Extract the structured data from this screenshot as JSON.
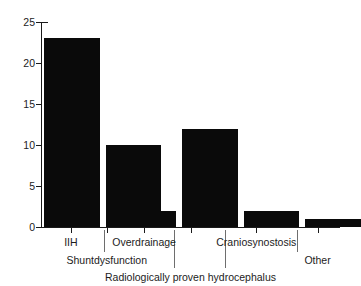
{
  "chart_data": {
    "type": "bar",
    "title": "",
    "subtitle": "",
    "xlabel": "",
    "ylabel": "",
    "categories": [
      "IIH",
      "Shuntdysfunction",
      "Overdrainage",
      "Radiologically proven hydrocephalus",
      "Craniosynostosis",
      "Other"
    ],
    "values": [
      23,
      10,
      2,
      12,
      2,
      1
    ],
    "ylim": [
      0,
      25
    ],
    "yticks": [
      0,
      5,
      10,
      15,
      20,
      25
    ],
    "ytick_labels": [
      "0",
      "5",
      "10",
      "15",
      "20",
      "25"
    ],
    "grid": false,
    "legend": "none",
    "bar_color": "#0a0a0a",
    "axis_color": "#1a1a1a",
    "tick_label_color": "#1c1c1c",
    "annotations": []
  },
  "axis": {
    "y": {
      "ticks": [
        {
          "value": 25,
          "label": "25"
        },
        {
          "value": 20,
          "label": "20"
        },
        {
          "value": 15,
          "label": "15"
        },
        {
          "value": 10,
          "label": "10"
        },
        {
          "value": 5,
          "label": "5"
        },
        {
          "value": 0,
          "label": "0"
        }
      ]
    },
    "x": {
      "tier1": [
        {
          "label": "IIH",
          "center_pct": 10.0
        },
        {
          "label": "Overdrainage",
          "center_pct": 34.5
        },
        {
          "label": "Craniosynostosis",
          "center_pct": 72.0
        }
      ],
      "tier2": [
        {
          "label": "Shuntdysfunction",
          "center_pct": 22.0
        },
        {
          "label": "Other",
          "center_pct": 92.5
        }
      ],
      "tier3": [
        {
          "label": "Radiologically proven hydrocephalus",
          "center_pct": 50.0
        }
      ],
      "separators_pct": [
        21.0,
        44.5,
        61.5,
        85.5
      ],
      "ticks_pct": [
        10.0,
        22.0,
        34.5,
        50.0,
        72.0,
        92.5
      ]
    }
  },
  "bars": [
    {
      "name": "IIH",
      "value": 23,
      "left_pct": 1.0,
      "width_pct": 18.6
    },
    {
      "name": "Shuntdysfunction",
      "value": 10,
      "left_pct": 21.6,
      "width_pct": 18.6
    },
    {
      "name": "Overdrainage",
      "value": 2,
      "left_pct": 26.6,
      "width_pct": 18.6
    },
    {
      "name": "Radiologically proven hydrocephalus",
      "value": 12,
      "left_pct": 47.2,
      "width_pct": 18.6
    },
    {
      "name": "Craniosynostosis",
      "value": 2,
      "left_pct": 67.8,
      "width_pct": 18.6
    },
    {
      "name": "Other",
      "value": 1,
      "left_pct": 88.4,
      "width_pct": 18.6
    }
  ]
}
